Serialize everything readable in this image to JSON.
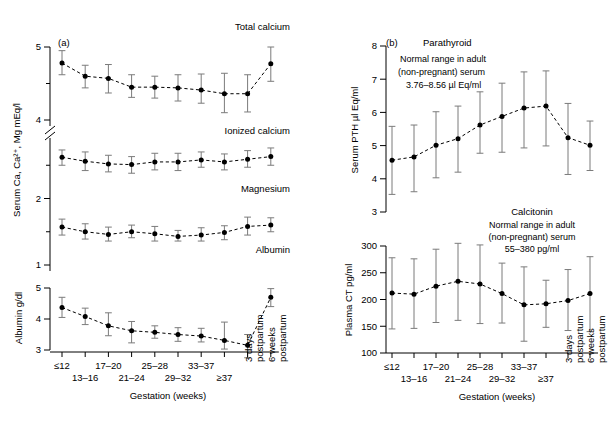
{
  "figure": {
    "panel_a_label": "(a)",
    "panel_b_label": "(b)"
  },
  "axes": {
    "x_title": "Gestation (weeks)",
    "y_title_a": "Serum Ca, Ca²⁺, Mg mEq/l",
    "y_title_albumin": "Albumin g/dl",
    "y_title_pth": "Serum PTH µl Eq/ml",
    "y_title_ct": "Plasma CT  pg/ml",
    "categories_row1": [
      "≤12",
      "",
      "17–20",
      "",
      "25–28",
      "",
      "33–37",
      "",
      "",
      ""
    ],
    "categories_row2": [
      "",
      "13–16",
      "",
      "21–24",
      "",
      "29–32",
      "",
      "≥37",
      "",
      ""
    ],
    "categories_rot": [
      "",
      "",
      "",
      "",
      "",
      "",
      "",
      "",
      "3 days\npostpartum",
      "6 weeks\npostpartum"
    ],
    "postpartum_3days_l1": "3 days",
    "postpartum_3days_l2": "postpartum",
    "postpartum_6weeks_l1": "6 weeks",
    "postpartum_6weeks_l2": "postpartum",
    "ticks_a": [
      "5",
      "4",
      "2",
      "1"
    ],
    "ticks_albumin": [
      "5",
      "4",
      "3"
    ],
    "ticks_pth": [
      "8",
      "7",
      "6",
      "5",
      "4",
      "3"
    ],
    "ticks_ct": [
      "300",
      "250",
      "200",
      "150",
      "100"
    ]
  },
  "series_labels": {
    "total_calcium": "Total calcium",
    "ionized_calcium": "Ionized calcium",
    "magnesium": "Magnesium",
    "albumin": "Albumin",
    "parathyroid": "Parathyroid",
    "calcitonin": "Calcitonin"
  },
  "notes": {
    "pth_line1": "Normal range in adult",
    "pth_line2": "(non-pregnant) serum",
    "pth_line3": "3.76–8.56 µl Eq/ml",
    "ct_line1": "Normal range in adult",
    "ct_line2": "(non-pregnant) serum",
    "ct_line3": "55–380 pg/ml"
  },
  "colors": {
    "ink": "#000000",
    "errorbar": "#7b7b7b",
    "background": "#ffffff"
  },
  "chart_data": [
    {
      "type": "line",
      "title": "Total calcium",
      "xlabel": "Gestation (weeks)",
      "ylabel": "Serum Ca, Ca²⁺, Mg mEq/l",
      "ylim": [
        4.0,
        5.0
      ],
      "grid": false,
      "legend": "none",
      "categories": [
        "≤12",
        "13–16",
        "17–20",
        "21–24",
        "25–28",
        "29–32",
        "33–37",
        "≥37",
        "3 days postpartum",
        "6 weeks postpartum"
      ],
      "values": [
        4.78,
        4.6,
        4.57,
        4.45,
        4.45,
        4.44,
        4.41,
        4.36,
        4.36,
        4.77
      ],
      "error_low": [
        4.62,
        4.44,
        4.37,
        4.31,
        4.3,
        4.26,
        4.23,
        4.1,
        4.11,
        4.53
      ],
      "error_high": [
        4.95,
        4.75,
        4.76,
        4.62,
        4.6,
        4.62,
        4.63,
        4.64,
        4.62,
        5.0
      ]
    },
    {
      "type": "line",
      "title": "Ionized calcium",
      "xlabel": "Gestation (weeks)",
      "ylabel": "Serum Ca, Ca²⁺, Mg mEq/l",
      "ylim": [
        2.0,
        3.0
      ],
      "grid": false,
      "legend": "none",
      "categories": [
        "≤12",
        "13–16",
        "17–20",
        "21–24",
        "25–28",
        "29–32",
        "33–37",
        "≥37",
        "3 days postpartum",
        "6 weeks postpartum"
      ],
      "values": [
        2.62,
        2.56,
        2.52,
        2.51,
        2.55,
        2.55,
        2.58,
        2.55,
        2.59,
        2.63
      ],
      "error_low": [
        2.5,
        2.42,
        2.4,
        2.38,
        2.43,
        2.42,
        2.47,
        2.43,
        2.47,
        2.5
      ],
      "error_high": [
        2.73,
        2.7,
        2.65,
        2.63,
        2.68,
        2.68,
        2.7,
        2.67,
        2.72,
        2.76
      ]
    },
    {
      "type": "line",
      "title": "Magnesium",
      "xlabel": "Gestation (weeks)",
      "ylabel": "Serum Ca, Ca²⁺, Mg mEq/l",
      "ylim": [
        1.0,
        2.0
      ],
      "grid": false,
      "legend": "none",
      "categories": [
        "≤12",
        "13–16",
        "17–20",
        "21–24",
        "25–28",
        "29–32",
        "33–37",
        "≥37",
        "3 days postpartum",
        "6 weeks postpartum"
      ],
      "values": [
        1.57,
        1.5,
        1.46,
        1.5,
        1.47,
        1.43,
        1.45,
        1.49,
        1.58,
        1.6
      ],
      "error_low": [
        1.45,
        1.39,
        1.36,
        1.41,
        1.36,
        1.36,
        1.36,
        1.38,
        1.45,
        1.5
      ],
      "error_high": [
        1.69,
        1.62,
        1.57,
        1.6,
        1.58,
        1.52,
        1.56,
        1.59,
        1.72,
        1.71
      ]
    },
    {
      "type": "line",
      "title": "Albumin",
      "xlabel": "Gestation (weeks)",
      "ylabel": "Albumin g/dl",
      "ylim": [
        3.0,
        5.0
      ],
      "grid": false,
      "legend": "none",
      "categories": [
        "≤12",
        "13–16",
        "17–20",
        "21–24",
        "25–28",
        "29–32",
        "33–37",
        "≥37",
        "3 days postpartum",
        "6 weeks postpartum"
      ],
      "values": [
        4.37,
        4.08,
        3.78,
        3.62,
        3.57,
        3.5,
        3.45,
        3.31,
        3.15,
        4.7
      ],
      "error_low": [
        4.05,
        3.82,
        3.46,
        3.23,
        3.38,
        3.28,
        3.26,
        3.03,
        2.75,
        4.4
      ],
      "error_high": [
        4.7,
        4.35,
        4.2,
        3.92,
        3.78,
        3.72,
        3.7,
        3.9,
        3.5,
        4.98
      ]
    },
    {
      "type": "line",
      "title": "Parathyroid",
      "xlabel": "Gestation (weeks)",
      "ylabel": "Serum PTH µl Eq/ml",
      "ylim": [
        3,
        8
      ],
      "grid": false,
      "legend": "none",
      "normal_range_label": "Normal range in adult (non-pregnant) serum 3.76–8.56 µl Eq/ml",
      "categories": [
        "≤12",
        "13–16",
        "17–20",
        "21–24",
        "25–28",
        "29–32",
        "33–37",
        "≥37",
        "3 days postpartum",
        "6 weeks postpartum"
      ],
      "values": [
        4.56,
        4.66,
        5.01,
        5.21,
        5.62,
        5.88,
        6.13,
        6.19,
        5.24,
        5.01
      ],
      "error_low": [
        3.53,
        3.61,
        4.03,
        4.2,
        4.77,
        4.8,
        4.93,
        4.99,
        4.13,
        4.25
      ],
      "error_high": [
        5.58,
        5.62,
        6.02,
        6.19,
        6.62,
        6.88,
        7.22,
        7.25,
        6.27,
        5.74
      ]
    },
    {
      "type": "line",
      "title": "Calcitonin",
      "xlabel": "Gestation (weeks)",
      "ylabel": "Plasma CT  pg/ml",
      "ylim": [
        100,
        300
      ],
      "grid": false,
      "legend": "none",
      "normal_range_label": "Normal range in adult (non-pregnant) serum 55–380 pg/ml",
      "categories": [
        "≤12",
        "13–16",
        "17–20",
        "21–24",
        "25–28",
        "29–32",
        "33–37",
        "≥37",
        "3 days postpartum",
        "6 weeks postpartum"
      ],
      "values": [
        212,
        210,
        225,
        234,
        229,
        211,
        190,
        192,
        198,
        211
      ],
      "error_low": [
        145,
        146,
        157,
        161,
        155,
        156,
        122,
        148,
        142,
        140
      ],
      "error_high": [
        278,
        276,
        294,
        305,
        302,
        268,
        261,
        236,
        256,
        280
      ]
    }
  ]
}
